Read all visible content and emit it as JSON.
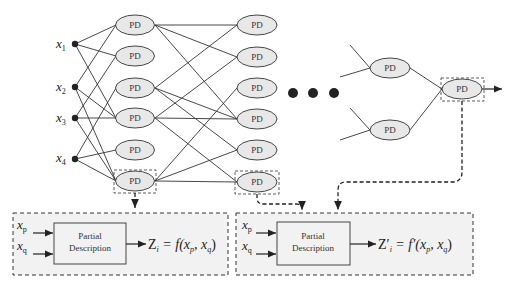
{
  "diagram": {
    "type": "GMDH polynomial neural network",
    "node_label": "PD",
    "inputs": [
      {
        "name": "x",
        "sub": "1"
      },
      {
        "name": "x",
        "sub": "2"
      },
      {
        "name": "x",
        "sub": "3"
      },
      {
        "name": "x",
        "sub": "4"
      }
    ],
    "layer1_count": 6,
    "layer2_count": 6,
    "ellipsis": "● ● ●",
    "detail_left": {
      "inputs": [
        {
          "name": "x",
          "sub": "p"
        },
        {
          "name": "x",
          "sub": "q"
        }
      ],
      "block_line1": "Partial",
      "block_line2": "Description",
      "equation_lhs": "Z",
      "equation_lhs_sub": "i",
      "equation_rhs_prefix": " = f(x",
      "equation_rhs_p": "p",
      "equation_rhs_mid": ", x",
      "equation_rhs_q": "q",
      "equation_rhs_suffix": ")"
    },
    "detail_right": {
      "inputs": [
        {
          "name": "x",
          "sub": "p"
        },
        {
          "name": "x",
          "sub": "q"
        }
      ],
      "block_line1": "Partial",
      "block_line2": "Description",
      "equation_lhs": "Z′",
      "equation_lhs_sub": "i",
      "equation_rhs_prefix": " = f′(x",
      "equation_rhs_p": "p",
      "equation_rhs_mid": ", x",
      "equation_rhs_q": "q",
      "equation_rhs_suffix": ")"
    },
    "colors": {
      "node_fill": "#e8e8e8",
      "line": "#333333",
      "detail_fill": "#f2f2f2",
      "dash": "#333333"
    }
  }
}
